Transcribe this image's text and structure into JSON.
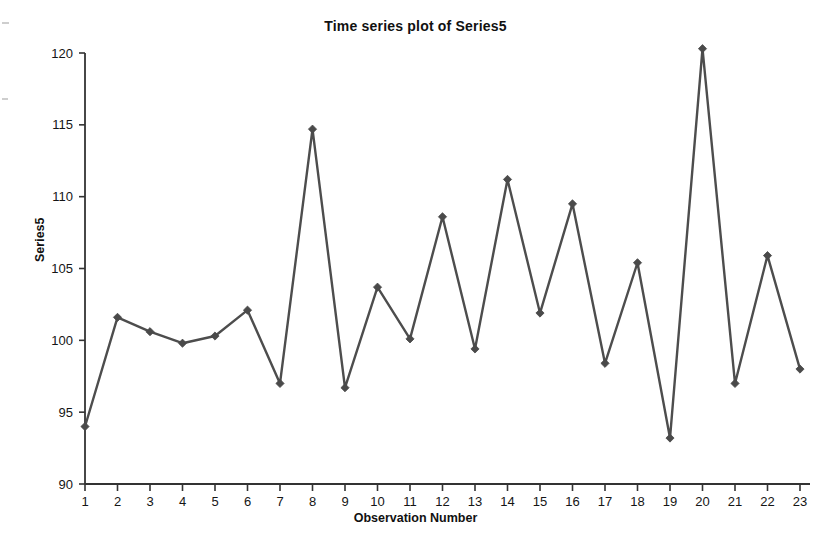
{
  "chart_data": {
    "type": "line",
    "title": "Time series plot of Series5",
    "xlabel": "Observation Number",
    "ylabel": "Series5",
    "grid": false,
    "legend": "none",
    "marker": "diamond",
    "line_color": "#4d4d4d",
    "marker_color": "#4a4a4a",
    "axis_color": "#333333",
    "background": "#ffffff",
    "xlim": [
      1,
      23
    ],
    "ylim": [
      90,
      120
    ],
    "x_ticks": [
      1,
      2,
      3,
      4,
      5,
      6,
      7,
      8,
      9,
      10,
      11,
      12,
      13,
      14,
      15,
      16,
      17,
      18,
      19,
      20,
      21,
      22,
      23
    ],
    "x_tick_labels": [
      "1",
      "2",
      "3",
      "4",
      "5",
      "6",
      "7",
      "8",
      "9",
      "10",
      "11",
      "12",
      "13",
      "14",
      "15",
      "16",
      "17",
      "18",
      "19",
      "20",
      "21",
      "22",
      "23"
    ],
    "y_ticks": [
      90,
      95,
      100,
      105,
      110,
      115,
      120
    ],
    "y_tick_labels": [
      "90",
      "95",
      "100",
      "105",
      "110",
      "115",
      "120"
    ],
    "x": [
      1,
      2,
      3,
      4,
      5,
      6,
      7,
      8,
      9,
      10,
      11,
      12,
      13,
      14,
      15,
      16,
      17,
      18,
      19,
      20,
      21,
      22,
      23
    ],
    "values": [
      94.0,
      101.6,
      100.6,
      99.8,
      100.3,
      102.1,
      97.0,
      114.7,
      96.7,
      103.7,
      100.1,
      108.6,
      99.4,
      111.2,
      101.9,
      109.5,
      98.4,
      105.4,
      93.2,
      120.3,
      97.0,
      105.9,
      98.0
    ],
    "series": [
      {
        "name": "Series5",
        "values": [
          94.0,
          101.6,
          100.6,
          99.8,
          100.3,
          102.1,
          97.0,
          114.7,
          96.7,
          103.7,
          100.1,
          108.6,
          99.4,
          111.2,
          101.9,
          109.5,
          98.4,
          105.4,
          93.2,
          120.3,
          97.0,
          105.9,
          98.0
        ]
      }
    ]
  }
}
